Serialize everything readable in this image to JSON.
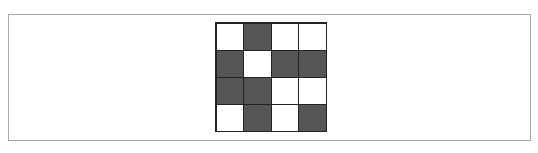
{
  "diagram": {
    "type": "grid-pattern",
    "rows": 4,
    "cols": 4,
    "colors": {
      "dark": "#555555",
      "light": "#ffffff",
      "border": "#222222"
    },
    "cells": [
      [
        "light",
        "dark",
        "light",
        "light"
      ],
      [
        "dark",
        "light",
        "dark",
        "dark"
      ],
      [
        "dark",
        "dark",
        "light",
        "light"
      ],
      [
        "light",
        "dark",
        "light",
        "dark"
      ]
    ]
  }
}
